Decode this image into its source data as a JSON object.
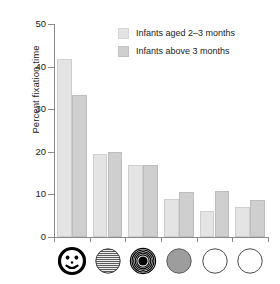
{
  "chart_data": {
    "type": "bar",
    "title": "",
    "subtitle": "",
    "xlabel": "",
    "ylabel": "Percent fixation time",
    "ylim": [
      0,
      50
    ],
    "yticks": [
      0,
      10,
      20,
      30,
      40,
      50
    ],
    "grid": false,
    "legend_position": "top-right",
    "categories": [
      "face",
      "horizontal-stripes",
      "bullseye",
      "gray-disc",
      "white-disc-1",
      "white-disc-2"
    ],
    "category_icons": [
      "face-icon",
      "stripes-icon",
      "bullseye-icon",
      "gray-disc-icon",
      "white-disc-icon",
      "white-disc-icon"
    ],
    "series": [
      {
        "name": "Infants aged 2–3 months",
        "color": "#e4e4e4",
        "values": [
          41.8,
          19.5,
          16.8,
          9.0,
          6.2,
          7.0
        ]
      },
      {
        "name": "Infants above 3 months",
        "color": "#cfcfcf",
        "values": [
          33.3,
          20.0,
          17.0,
          10.6,
          10.7,
          8.8
        ]
      }
    ]
  },
  "axis": {
    "ylabel": "Percent fixation time",
    "tick_labels": [
      "0",
      "10",
      "20",
      "30",
      "40",
      "50"
    ]
  },
  "legend": {
    "entries": [
      {
        "label": "Infants aged 2–3 months",
        "color": "#e4e4e4"
      },
      {
        "label": "Infants above 3 months",
        "color": "#cfcfcf"
      }
    ]
  },
  "colors": {
    "series_1": "#e4e4e4",
    "series_2": "#cfcfcf",
    "axis": "#8a8a8a",
    "text": "#1a1a1a",
    "gray_disc": "#9d9d9d",
    "background": "#ffffff"
  }
}
